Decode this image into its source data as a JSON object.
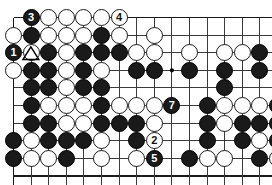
{
  "diagram": {
    "kind": "go-board-diagram",
    "board": {
      "cell": 17.6,
      "origin_x": 13.5,
      "origin_y": 17.5,
      "cols": 15,
      "rows": 9,
      "line_color": "#3a3a3a",
      "edge_color": "#1a1a1a",
      "background": "#ffffff",
      "stone_radius": 8.6,
      "edges": {
        "top": true,
        "left": true,
        "bottom": true,
        "right": false
      },
      "star_points": [
        {
          "col": 10,
          "row": 4
        }
      ]
    },
    "colors": {
      "black": "#1a1a1a",
      "white": "#ffffff",
      "label_on_black": "#ffffff",
      "label_on_white": "#111111",
      "marker": "#000000"
    },
    "stones": [
      {
        "col": 2,
        "row": 1,
        "color": "black",
        "label": "3"
      },
      {
        "col": 3,
        "row": 1,
        "color": "white"
      },
      {
        "col": 4,
        "row": 1,
        "color": "white"
      },
      {
        "col": 5,
        "row": 1,
        "color": "white"
      },
      {
        "col": 6,
        "row": 1,
        "color": "white"
      },
      {
        "col": 7,
        "row": 1,
        "color": "white",
        "label": "4"
      },
      {
        "col": 1,
        "row": 2,
        "color": "white"
      },
      {
        "col": 2,
        "row": 2,
        "color": "black"
      },
      {
        "col": 3,
        "row": 2,
        "color": "white"
      },
      {
        "col": 4,
        "row": 2,
        "color": "white"
      },
      {
        "col": 5,
        "row": 2,
        "color": "white"
      },
      {
        "col": 6,
        "row": 2,
        "color": "black"
      },
      {
        "col": 7,
        "row": 2,
        "color": "white"
      },
      {
        "col": 9,
        "row": 2,
        "color": "white"
      },
      {
        "col": 1,
        "row": 3,
        "color": "black",
        "label": "1"
      },
      {
        "col": 2,
        "row": 3,
        "color": "white",
        "marker": "triangle"
      },
      {
        "col": 3,
        "row": 3,
        "color": "black"
      },
      {
        "col": 4,
        "row": 3,
        "color": "white"
      },
      {
        "col": 5,
        "row": 3,
        "color": "black"
      },
      {
        "col": 6,
        "row": 3,
        "color": "black"
      },
      {
        "col": 7,
        "row": 3,
        "color": "black"
      },
      {
        "col": 8,
        "row": 3,
        "color": "white"
      },
      {
        "col": 9,
        "row": 3,
        "color": "white"
      },
      {
        "col": 11,
        "row": 3,
        "color": "white"
      },
      {
        "col": 13,
        "row": 3,
        "color": "white"
      },
      {
        "col": 14,
        "row": 3,
        "color": "white"
      },
      {
        "col": 15,
        "row": 3,
        "color": "black"
      },
      {
        "col": 1,
        "row": 4,
        "color": "white"
      },
      {
        "col": 2,
        "row": 4,
        "color": "black"
      },
      {
        "col": 3,
        "row": 4,
        "color": "black"
      },
      {
        "col": 4,
        "row": 4,
        "color": "white"
      },
      {
        "col": 5,
        "row": 4,
        "color": "black"
      },
      {
        "col": 6,
        "row": 4,
        "color": "white"
      },
      {
        "col": 8,
        "row": 4,
        "color": "black"
      },
      {
        "col": 9,
        "row": 4,
        "color": "black"
      },
      {
        "col": 11,
        "row": 4,
        "color": "black"
      },
      {
        "col": 13,
        "row": 4,
        "color": "black"
      },
      {
        "col": 15,
        "row": 4,
        "color": "black"
      },
      {
        "col": 2,
        "row": 5,
        "color": "black"
      },
      {
        "col": 3,
        "row": 5,
        "color": "black"
      },
      {
        "col": 4,
        "row": 5,
        "color": "white"
      },
      {
        "col": 5,
        "row": 5,
        "color": "black"
      },
      {
        "col": 6,
        "row": 5,
        "color": "black"
      },
      {
        "col": 13,
        "row": 5,
        "color": "black"
      },
      {
        "col": 2,
        "row": 6,
        "color": "black"
      },
      {
        "col": 3,
        "row": 6,
        "color": "white"
      },
      {
        "col": 4,
        "row": 6,
        "color": "white"
      },
      {
        "col": 5,
        "row": 6,
        "color": "white"
      },
      {
        "col": 6,
        "row": 6,
        "color": "black"
      },
      {
        "col": 7,
        "row": 6,
        "color": "white"
      },
      {
        "col": 8,
        "row": 6,
        "color": "white"
      },
      {
        "col": 9,
        "row": 6,
        "color": "white"
      },
      {
        "col": 10,
        "row": 6,
        "color": "black",
        "label": "7"
      },
      {
        "col": 12,
        "row": 6,
        "color": "black"
      },
      {
        "col": 13,
        "row": 6,
        "color": "white"
      },
      {
        "col": 14,
        "row": 6,
        "color": "white"
      },
      {
        "col": 15,
        "row": 6,
        "color": "white"
      },
      {
        "col": 16,
        "row": 6,
        "color": "black"
      },
      {
        "col": 2,
        "row": 7,
        "color": "black"
      },
      {
        "col": 3,
        "row": 7,
        "color": "black"
      },
      {
        "col": 4,
        "row": 7,
        "color": "white"
      },
      {
        "col": 5,
        "row": 7,
        "color": "white"
      },
      {
        "col": 6,
        "row": 7,
        "color": "black"
      },
      {
        "col": 7,
        "row": 7,
        "color": "black"
      },
      {
        "col": 8,
        "row": 7,
        "color": "black"
      },
      {
        "col": 9,
        "row": 7,
        "color": "white"
      },
      {
        "col": 12,
        "row": 7,
        "color": "black"
      },
      {
        "col": 13,
        "row": 7,
        "color": "white"
      },
      {
        "col": 14,
        "row": 7,
        "color": "black"
      },
      {
        "col": 15,
        "row": 7,
        "color": "black"
      },
      {
        "col": 16,
        "row": 7,
        "color": "black"
      },
      {
        "col": 1,
        "row": 8,
        "color": "black"
      },
      {
        "col": 2,
        "row": 8,
        "color": "white"
      },
      {
        "col": 3,
        "row": 8,
        "color": "black"
      },
      {
        "col": 4,
        "row": 8,
        "color": "black"
      },
      {
        "col": 5,
        "row": 8,
        "color": "black"
      },
      {
        "col": 6,
        "row": 8,
        "color": "white"
      },
      {
        "col": 8,
        "row": 8,
        "color": "black"
      },
      {
        "col": 9,
        "row": 8,
        "color": "white",
        "label": "2"
      },
      {
        "col": 12,
        "row": 8,
        "color": "black"
      },
      {
        "col": 14,
        "row": 8,
        "color": "black"
      },
      {
        "col": 15,
        "row": 8,
        "color": "white"
      },
      {
        "col": 16,
        "row": 8,
        "color": "black"
      },
      {
        "col": 1,
        "row": 9,
        "color": "black"
      },
      {
        "col": 2,
        "row": 9,
        "color": "white"
      },
      {
        "col": 3,
        "row": 9,
        "color": "white"
      },
      {
        "col": 4,
        "row": 9,
        "color": "black"
      },
      {
        "col": 6,
        "row": 9,
        "color": "white"
      },
      {
        "col": 8,
        "row": 9,
        "color": "white"
      },
      {
        "col": 9,
        "row": 9,
        "color": "black",
        "label": "5"
      },
      {
        "col": 11,
        "row": 9,
        "color": "black"
      },
      {
        "col": 12,
        "row": 9,
        "color": "white"
      },
      {
        "col": 13,
        "row": 9,
        "color": "white"
      },
      {
        "col": 15,
        "row": 9,
        "color": "black"
      },
      {
        "col": 16,
        "row": 9,
        "color": "white"
      },
      {
        "col": 17,
        "row": 9,
        "color": "black"
      }
    ],
    "move_labels": [
      "1",
      "2",
      "3",
      "4",
      "5",
      "7"
    ],
    "markers": [
      "triangle"
    ]
  }
}
